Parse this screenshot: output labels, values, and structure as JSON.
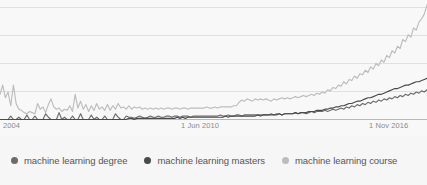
{
  "chart_data": {
    "type": "line",
    "title": "",
    "subtitle": "",
    "xlabel": "",
    "ylabel": "",
    "grid": true,
    "legend_position": "bottom",
    "ylim": [
      0,
      100
    ],
    "xlim": [
      "2004-01",
      "2017-06"
    ],
    "x_tick_labels": [
      "2004",
      "1 Jun 2010",
      "1 Nov 2016"
    ],
    "x_tick_positions_px": [
      6,
      192,
      384
    ],
    "y_gridlines": [
      20,
      40,
      60,
      80
    ],
    "series": [
      {
        "name": "machine learning degree",
        "color": "#6b6b6b",
        "values": [
          0,
          0,
          0,
          0,
          3,
          0,
          0,
          2,
          0,
          0,
          4,
          0,
          0,
          3,
          0,
          0,
          0,
          5,
          2,
          0,
          0,
          0,
          6,
          0,
          2,
          0,
          0,
          3,
          0,
          0,
          5,
          0,
          0,
          0,
          4,
          0,
          2,
          0,
          0,
          3,
          0,
          0,
          0,
          5,
          2,
          0,
          0,
          3,
          2,
          2,
          1,
          2,
          3,
          2,
          1,
          2,
          3,
          2,
          2,
          3,
          2,
          2,
          3,
          3,
          2,
          3,
          3,
          2,
          3,
          3,
          3,
          2,
          3,
          3,
          3,
          3,
          3,
          3,
          3,
          3,
          3,
          3,
          4,
          3,
          3,
          4,
          3,
          3,
          4,
          4,
          3,
          4,
          4,
          4,
          4,
          4,
          4,
          4,
          4,
          4,
          4,
          5,
          4,
          5,
          5,
          4,
          5,
          5,
          5,
          5,
          6,
          5,
          6,
          6,
          5,
          6,
          7,
          6,
          7,
          7,
          7,
          8,
          7,
          8,
          9,
          8,
          9,
          10,
          9,
          11,
          10,
          12,
          11,
          13,
          12,
          14,
          13,
          15,
          14,
          16,
          15,
          17,
          16,
          18,
          17,
          19,
          18,
          20,
          19,
          21,
          20,
          22,
          21,
          23,
          22,
          24,
          23,
          25,
          24,
          26
        ]
      },
      {
        "name": "machine learning masters",
        "color": "#4a4a4a",
        "values": [
          0,
          0,
          0,
          0,
          0,
          0,
          0,
          0,
          0,
          0,
          0,
          0,
          0,
          0,
          0,
          0,
          0,
          0,
          0,
          0,
          0,
          0,
          0,
          0,
          0,
          0,
          0,
          0,
          0,
          0,
          0,
          0,
          0,
          0,
          0,
          0,
          0,
          0,
          0,
          0,
          0,
          0,
          0,
          0,
          0,
          0,
          0,
          0,
          1,
          1,
          0,
          1,
          1,
          1,
          1,
          1,
          1,
          1,
          1,
          1,
          1,
          1,
          1,
          1,
          1,
          1,
          2,
          1,
          2,
          1,
          2,
          2,
          2,
          2,
          2,
          2,
          2,
          2,
          2,
          2,
          2,
          2,
          2,
          2,
          3,
          2,
          3,
          3,
          3,
          3,
          3,
          3,
          3,
          3,
          3,
          3,
          4,
          3,
          4,
          4,
          4,
          4,
          4,
          4,
          5,
          4,
          5,
          5,
          5,
          5,
          6,
          5,
          6,
          6,
          6,
          7,
          7,
          7,
          8,
          8,
          8,
          9,
          9,
          10,
          10,
          11,
          11,
          12,
          12,
          13,
          14,
          14,
          15,
          16,
          16,
          17,
          18,
          19,
          19,
          20,
          21,
          22,
          22,
          23,
          24,
          25,
          26,
          27,
          27,
          28,
          29,
          30,
          30,
          31,
          32,
          33,
          33,
          34,
          35,
          36
        ]
      },
      {
        "name": "machine learning course",
        "color": "#bcbcbc",
        "values": [
          22,
          30,
          19,
          24,
          12,
          30,
          14,
          9,
          8,
          6,
          5,
          7,
          6,
          5,
          14,
          9,
          11,
          6,
          13,
          18,
          11,
          9,
          10,
          7,
          9,
          8,
          12,
          7,
          22,
          10,
          16,
          9,
          13,
          7,
          12,
          8,
          14,
          9,
          11,
          8,
          13,
          8,
          12,
          9,
          14,
          10,
          11,
          9,
          12,
          9,
          11,
          10,
          11,
          9,
          10,
          9,
          10,
          9,
          10,
          9,
          10,
          9,
          10,
          10,
          9,
          10,
          10,
          9,
          10,
          10,
          9,
          10,
          10,
          10,
          10,
          10,
          10,
          11,
          10,
          10,
          11,
          10,
          11,
          11,
          11,
          11,
          11,
          12,
          12,
          15,
          17,
          16,
          18,
          17,
          16,
          18,
          17,
          18,
          17,
          18,
          17,
          16,
          18,
          17,
          18,
          19,
          18,
          19,
          18,
          19,
          20,
          19,
          20,
          21,
          20,
          21,
          22,
          21,
          23,
          22,
          24,
          23,
          26,
          25,
          28,
          27,
          30,
          29,
          33,
          31,
          35,
          34,
          38,
          36,
          40,
          39,
          43,
          41,
          46,
          44,
          49,
          47,
          52,
          50,
          56,
          54,
          60,
          58,
          64,
          62,
          70,
          68,
          74,
          72,
          80,
          78,
          85,
          88,
          92,
          100
        ]
      }
    ]
  },
  "legend": {
    "items": [
      {
        "label": "machine learning degree",
        "color": "#6b6b6b"
      },
      {
        "label": "machine learning masters",
        "color": "#4a4a4a"
      },
      {
        "label": "machine learning course",
        "color": "#bcbcbc"
      }
    ]
  },
  "axis": {
    "x_labels": [
      "2004",
      "1 Jun 2010",
      "1 Nov 2016"
    ]
  }
}
